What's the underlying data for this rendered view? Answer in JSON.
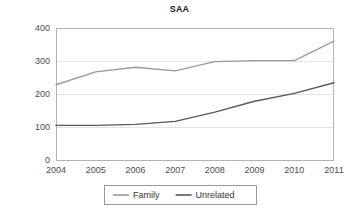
{
  "chart_data": {
    "type": "line",
    "title": "SAA",
    "xlabel": "",
    "ylabel": "",
    "categories": [
      "2004",
      "2005",
      "2006",
      "2007",
      "2008",
      "2009",
      "2010",
      "2011"
    ],
    "series": [
      {
        "name": "Family",
        "color": "#9a9a9a",
        "values": [
          228,
          267,
          281,
          270,
          298,
          301,
          301,
          360
        ]
      },
      {
        "name": "Unrelated",
        "color": "#595959",
        "values": [
          105,
          105,
          108,
          117,
          145,
          178,
          202,
          234
        ]
      }
    ],
    "ylim": [
      0,
      400
    ],
    "yticks": [
      "0",
      "100",
      "200",
      "300",
      "400"
    ],
    "ytick_values": [
      0,
      100,
      200,
      300,
      400
    ],
    "grid": true,
    "grid_axis": "y",
    "legend_position": "bottom"
  },
  "legend": {
    "entries": [
      {
        "label": "Family",
        "color": "#9a9a9a"
      },
      {
        "label": "Unrelated",
        "color": "#595959"
      }
    ]
  },
  "colors": {
    "family": "#9a9a9a",
    "unrelated": "#595959",
    "grid": "#e3e3e3",
    "axis": "#b3b3b3",
    "text": "#4d4d4d",
    "title": "#1a1a1a",
    "background": "#ffffff"
  }
}
